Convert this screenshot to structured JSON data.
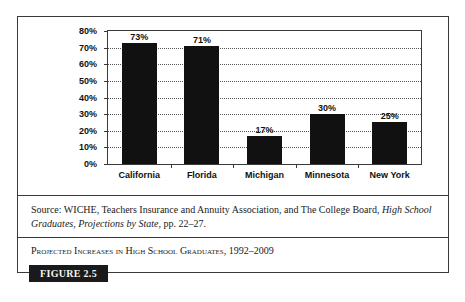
{
  "chart_data": {
    "type": "bar",
    "title": "Projected Increases in High School Graduates, 1992–2009",
    "categories": [
      "California",
      "Florida",
      "Michigan",
      "Minnesota",
      "New York"
    ],
    "values": [
      73,
      71,
      17,
      30,
      25
    ],
    "value_labels": [
      "73%",
      "71%",
      "17%",
      "30%",
      "25%"
    ],
    "xlabel": "",
    "ylabel": "",
    "ylim": [
      0,
      80
    ],
    "yticks": [
      "0%",
      "10%",
      "20%",
      "30%",
      "40%",
      "50%",
      "60%",
      "70%",
      "80%"
    ],
    "grid": "horizontal dotted",
    "legend": null,
    "bar_color": "#111111"
  },
  "source": {
    "prefix": "Source: WICHE, Teachers Insurance and Annuity Association, and The College Board, ",
    "italic_title": "High School Graduates, Projections by State",
    "suffix": ", pp. 22–27."
  },
  "caption": {
    "text": "Projected Increases in High School Graduates",
    "years": ", 1992–2009"
  },
  "figure_label": "FIGURE 2.5"
}
